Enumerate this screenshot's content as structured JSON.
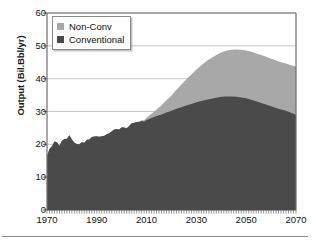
{
  "chart_data": {
    "type": "area",
    "stacked": true,
    "title": "",
    "xlabel": "",
    "ylabel": "Output (Bil.Bbl/yr)",
    "xlim": [
      1970,
      2070
    ],
    "ylim": [
      0,
      60
    ],
    "ytick_labels": [
      "0",
      "10",
      "20",
      "30",
      "40",
      "50",
      "60"
    ],
    "ytick_values": [
      0,
      10,
      20,
      30,
      40,
      50,
      60
    ],
    "xtick_labels": [
      "1970",
      "1990",
      "2010",
      "2030",
      "2050",
      "2070"
    ],
    "xtick_values": [
      1970,
      1990,
      2010,
      2030,
      2050,
      2070
    ],
    "minor_xticks": true,
    "grid": "horizontal",
    "legend_position": "top-left",
    "legend": [
      "Non-Conv",
      "Conventional"
    ],
    "colors": {
      "non_conv": "#a8a8a8",
      "conventional": "#4a4a4a",
      "axis": "#6e6e6e",
      "grid": "#b9b9b9",
      "text": "#111111"
    },
    "x": [
      1970,
      1971,
      1972,
      1973,
      1974,
      1975,
      1976,
      1977,
      1978,
      1979,
      1980,
      1981,
      1982,
      1983,
      1984,
      1985,
      1986,
      1987,
      1988,
      1989,
      1990,
      1991,
      1992,
      1993,
      1994,
      1995,
      1996,
      1997,
      1998,
      1999,
      2000,
      2001,
      2002,
      2003,
      2004,
      2005,
      2006,
      2007,
      2008,
      2009,
      2010,
      2012,
      2014,
      2016,
      2018,
      2020,
      2022,
      2024,
      2026,
      2028,
      2030,
      2032,
      2034,
      2036,
      2038,
      2040,
      2042,
      2044,
      2046,
      2048,
      2050,
      2052,
      2054,
      2056,
      2058,
      2060,
      2062,
      2064,
      2066,
      2068,
      2070
    ],
    "series": [
      {
        "name": "Conventional",
        "values": [
          16.5,
          18.6,
          19.4,
          20.9,
          20.6,
          19.6,
          21.1,
          21.6,
          21.7,
          22.8,
          21.5,
          20.5,
          20.1,
          20.0,
          20.6,
          20.5,
          21.4,
          21.5,
          22.2,
          22.4,
          22.5,
          22.3,
          22.5,
          22.6,
          23.1,
          23.4,
          24.0,
          24.5,
          24.7,
          24.5,
          25.2,
          25.1,
          24.9,
          25.6,
          26.4,
          26.6,
          26.8,
          26.9,
          27.1,
          26.9,
          27.4,
          28.0,
          28.6,
          29.1,
          29.7,
          30.2,
          30.8,
          31.3,
          31.8,
          32.3,
          32.8,
          33.2,
          33.6,
          33.9,
          34.2,
          34.5,
          34.6,
          34.6,
          34.5,
          34.3,
          34.0,
          33.6,
          33.1,
          32.6,
          32.1,
          31.6,
          31.1,
          30.6,
          30.2,
          29.6,
          29.0
        ]
      },
      {
        "name": "Non-Conv",
        "values": [
          0,
          0,
          0,
          0,
          0,
          0,
          0,
          0,
          0,
          0,
          0,
          0,
          0,
          0,
          0,
          0,
          0,
          0,
          0,
          0,
          0,
          0,
          0,
          0,
          0,
          0,
          0,
          0,
          0,
          0,
          0,
          0,
          0,
          0,
          0,
          0,
          0,
          0,
          0.2,
          0.4,
          0.7,
          1.3,
          2.0,
          2.8,
          3.7,
          4.7,
          5.8,
          6.9,
          8.0,
          9.0,
          10.0,
          10.9,
          11.7,
          12.4,
          13.0,
          13.5,
          13.9,
          14.2,
          14.4,
          14.5,
          14.6,
          14.6,
          14.6,
          14.6,
          14.6,
          14.5,
          14.4,
          14.4,
          14.4,
          14.5,
          14.7
        ]
      }
    ],
    "totals_note": "Total peaks near 49 around 2050; conventional peaks near 34.6 around 2043",
    "annotations": []
  }
}
